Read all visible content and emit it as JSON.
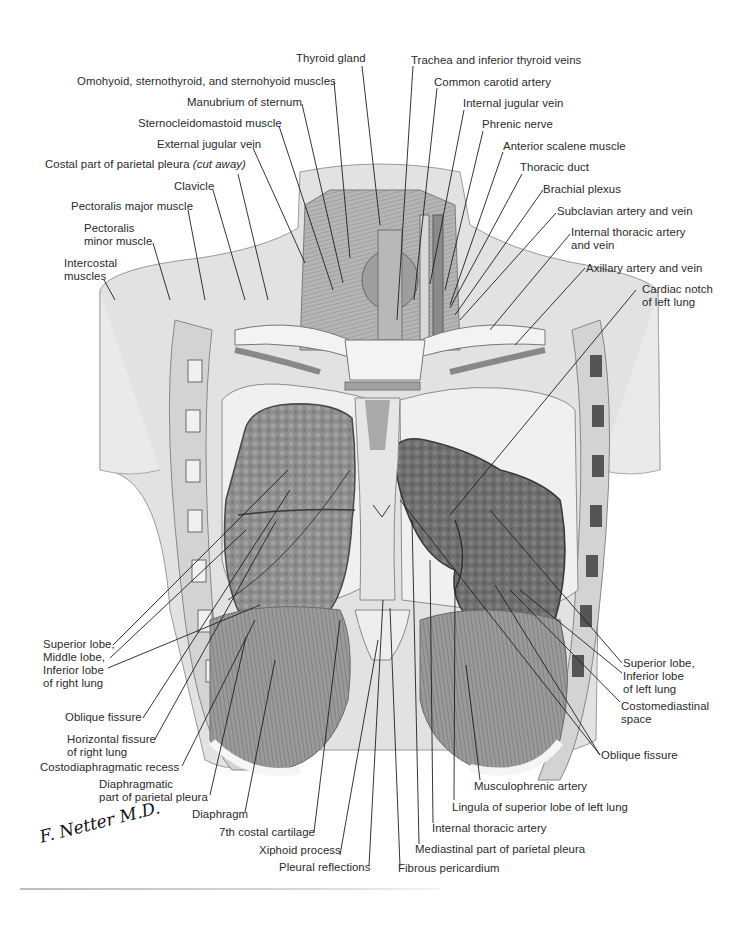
{
  "figure": {
    "style": "grayscale anatomical illustration",
    "signature": "F. Netter M.D."
  },
  "labels": {
    "thyroid_gland": "Thyroid gland",
    "omohyoid": "Omohyoid, sternothyroid, and sternohyoid muscles",
    "manubrium": "Manubrium of sternum",
    "sternocleidomastoid": "Sternocleidomastoid muscle",
    "external_jugular": "External jugular vein",
    "costal_pleura": "Costal part of parietal pleura",
    "costal_pleura_note": "(cut away)",
    "clavicle": "Clavicle",
    "pectoralis_major": "Pectoralis major muscle",
    "pectoralis_minor_1": "Pectoralis",
    "pectoralis_minor_2": "minor muscle",
    "intercostal_1": "Intercostal",
    "intercostal_2": "muscles",
    "trachea": "Trachea and inferior thyroid veins",
    "common_carotid": "Common carotid artery",
    "internal_jugular": "Internal jugular vein",
    "phrenic": "Phrenic nerve",
    "anterior_scalene": "Anterior scalene muscle",
    "thoracic_duct": "Thoracic duct",
    "brachial_plexus": "Brachial plexus",
    "subclavian": "Subclavian artery and vein",
    "internal_thoracic_av_1": "Internal thoracic artery",
    "internal_thoracic_av_2": "and vein",
    "axillary": "Axillary artery and vein",
    "cardiac_notch_1": "Cardiac notch",
    "cardiac_notch_2": "of left lung",
    "right_lobes_1": "Superior lobe,",
    "right_lobes_2": "Middle lobe,",
    "right_lobes_3": "Inferior lobe",
    "right_lobes_4": "of right lung",
    "oblique_fissure_right": "Oblique fissure",
    "horizontal_fissure_1": "Horizontal fissure",
    "horizontal_fissure_2": "of right lung",
    "costodiaphragmatic": "Costodiaphragmatic recess",
    "diaphragmatic_pleura_1": "Diaphragmatic",
    "diaphragmatic_pleura_2": "part of parietal pleura",
    "diaphragm": "Diaphragm",
    "costal_cartilage": "7th costal cartilage",
    "xiphoid": "Xiphoid process",
    "pleural_reflections": "Pleural reflections",
    "fibrous_pericardium": "Fibrous pericardium",
    "mediastinal_pleura": "Mediastinal part of parietal pleura",
    "internal_thoracic_artery": "Internal thoracic artery",
    "lingula": "Lingula of superior lobe of left lung",
    "musculophrenic": "Musculophrenic artery",
    "oblique_fissure_left": "Oblique fissure",
    "costomediastinal_1": "Costomediastinal",
    "costomediastinal_2": "space",
    "left_lobes_1": "Superior lobe,",
    "left_lobes_2": "Inferior lobe",
    "left_lobes_3": "of left lung"
  },
  "colors": {
    "ink": "#2b2b2b",
    "skin": "#e3e3e3",
    "skin_shadow": "#c9c9c9",
    "lung": "#8f8f8f",
    "lung_dark": "#6f6f6f",
    "pleura": "#efefef",
    "bone": "#f2f2f2",
    "muscle": "#a9a9a9"
  }
}
